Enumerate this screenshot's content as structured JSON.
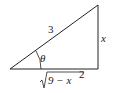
{
  "diagram": {
    "type": "right-triangle",
    "hypotenuse_label": "3",
    "opposite_label": "x",
    "angle_label": "θ",
    "adjacent_label": {
      "radical": "√",
      "radicand": "9 − x",
      "exponent": "2"
    },
    "line_color": "#222222"
  }
}
